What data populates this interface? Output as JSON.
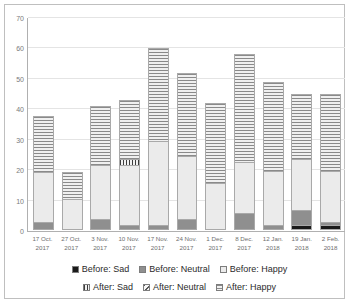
{
  "chart_data": {
    "type": "bar",
    "title": "",
    "xlabel": "",
    "ylabel": "",
    "ylim": [
      0,
      70
    ],
    "ytick_step": 10,
    "yticks": [
      0,
      10,
      20,
      30,
      40,
      50,
      60,
      70
    ],
    "grid": true,
    "stacked": true,
    "legend_position": "bottom",
    "categories": [
      "17 Oct. 2017",
      "27 Oct. 2017",
      "3 Nov. 2017",
      "10 Nov. 2017",
      "17 Nov. 2017",
      "24 Nov. 2017",
      "1 Dec. 2017",
      "8 Dec. 2017",
      "12 Jan. 2018",
      "19 Jan. 2018",
      "2 Feb. 2018"
    ],
    "category_lines": [
      [
        "17 Oct.",
        "2017"
      ],
      [
        "27 Oct.",
        "2017"
      ],
      [
        "3 Nov.",
        "2017"
      ],
      [
        "10 Nov.",
        "2017"
      ],
      [
        "17 Nov.",
        "2017"
      ],
      [
        "24 Nov.",
        "2017"
      ],
      [
        "1 Dec.",
        "2017"
      ],
      [
        "8 Dec.",
        "2017"
      ],
      [
        "12 Jan.",
        "2018"
      ],
      [
        "19 Jan.",
        "2018"
      ],
      [
        "2 Feb.",
        "2018"
      ]
    ],
    "series": [
      {
        "name": "Before: Sad",
        "fill": "before-sad",
        "color": "#1a1a1a",
        "values": [
          0,
          0,
          0,
          0,
          0,
          0,
          0,
          0,
          0,
          1,
          1
        ]
      },
      {
        "name": "Before: Neutral",
        "fill": "before-neutral",
        "color": "#8f8f8f",
        "values": [
          2,
          0,
          3,
          1,
          1,
          3,
          0,
          5,
          1,
          5,
          1
        ]
      },
      {
        "name": "Before: Happy",
        "fill": "before-happy",
        "color": "#ebebeb",
        "values": [
          17,
          10,
          18,
          20,
          28,
          21,
          15,
          17,
          18,
          17,
          17
        ]
      },
      {
        "name": "After: Sad",
        "fill": "after-sad",
        "color": "#3d3d3d",
        "values": [
          0,
          0,
          0,
          2,
          0,
          0,
          0,
          0,
          0,
          0,
          0
        ]
      },
      {
        "name": "After: Neutral",
        "fill": "after-neutral",
        "color": "#5a5a5a",
        "values": [
          0,
          0,
          0,
          0,
          0,
          0,
          0,
          0,
          0,
          0,
          0
        ]
      },
      {
        "name": "After: Happy",
        "fill": "after-happy",
        "color": "#8a8a8a",
        "values": [
          18.5,
          9,
          20,
          20,
          31,
          28,
          27,
          36,
          30,
          22,
          26
        ]
      }
    ],
    "totals": [
      37.5,
      19,
      41,
      43,
      60,
      52,
      42,
      58,
      49,
      45,
      45
    ],
    "legend": [
      {
        "label": "Before: Sad",
        "fill": "before-sad"
      },
      {
        "label": "Before: Neutral",
        "fill": "before-neutral"
      },
      {
        "label": "Before: Happy",
        "fill": "before-happy"
      },
      {
        "label": "After: Sad",
        "fill": "after-sad"
      },
      {
        "label": "After: Neutral",
        "fill": "after-neutral"
      },
      {
        "label": "After: Happy",
        "fill": "after-happy"
      }
    ]
  }
}
